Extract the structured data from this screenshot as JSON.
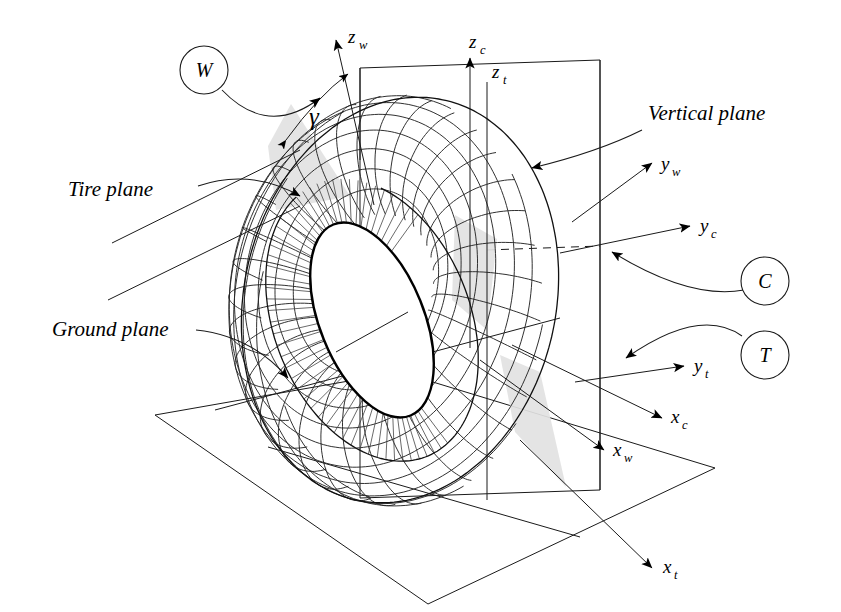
{
  "figure": {
    "background_color": "#ffffff",
    "line_color": "#000000",
    "shade_color": "#e2e2e2",
    "width": 841,
    "height": 612
  },
  "plane_labels": [
    {
      "key": "tire_plane",
      "text": "Tire plane",
      "x": 68,
      "y": 196
    },
    {
      "key": "ground_plane",
      "text": "Ground plane",
      "x": 52,
      "y": 336
    },
    {
      "key": "vertical_plane",
      "text": "Vertical plane",
      "x": 648,
      "y": 120
    }
  ],
  "angle_labels": [
    {
      "key": "camber_angle",
      "text": "γ",
      "x": 309,
      "y": 125
    }
  ],
  "circle_labels": [
    {
      "key": "W",
      "text": "W",
      "cx": 204,
      "cy": 70,
      "r": 24
    },
    {
      "key": "C",
      "text": "C",
      "cx": 765,
      "cy": 281,
      "r": 24
    },
    {
      "key": "T",
      "text": "T",
      "cx": 765,
      "cy": 355,
      "r": 24
    }
  ],
  "axis_labels": [
    {
      "key": "z_w",
      "base": "z",
      "sub": "w",
      "x": 348,
      "y": 43
    },
    {
      "key": "z_c",
      "base": "z",
      "sub": "c",
      "x": 469,
      "y": 48
    },
    {
      "key": "z_t",
      "base": "z",
      "sub": "t",
      "x": 492,
      "y": 78
    },
    {
      "key": "y_w",
      "base": "y",
      "sub": "w",
      "x": 661,
      "y": 170
    },
    {
      "key": "y_c",
      "base": "y",
      "sub": "c",
      "x": 700,
      "y": 232
    },
    {
      "key": "y_t",
      "base": "y",
      "sub": "t",
      "x": 694,
      "y": 372
    },
    {
      "key": "x_c",
      "base": "x",
      "sub": "c",
      "x": 671,
      "y": 423
    },
    {
      "key": "x_w",
      "base": "x",
      "sub": "w",
      "x": 613,
      "y": 456
    },
    {
      "key": "x_t",
      "base": "x",
      "sub": "t",
      "x": 663,
      "y": 573
    }
  ],
  "tire": {
    "center_x": 400,
    "center_y": 300,
    "major_radius": 132,
    "tube_radius": 72,
    "mesh_u_count": 34,
    "mesh_v_count": 15,
    "rim_rx": 52,
    "rim_ry": 103,
    "rim_rotation_deg": -22
  },
  "ground_plane_polygon": [
    [
      155,
      415
    ],
    [
      400,
      372
    ],
    [
      715,
      468
    ],
    [
      428,
      604
    ]
  ],
  "ground_plane_fold": [
    [
      268,
      447
    ],
    [
      580,
      537
    ]
  ],
  "vertical_plane_polygon": [
    [
      360,
      68
    ],
    [
      600,
      60
    ],
    [
      600,
      490
    ],
    [
      360,
      498
    ]
  ],
  "notes": {
    "description": "Three-dimensional wireframe tire with ground plane, vertical plane and tire plane, showing SAE wheel (W), contact (C) and tire (T) axis systems and camber angle gamma."
  }
}
